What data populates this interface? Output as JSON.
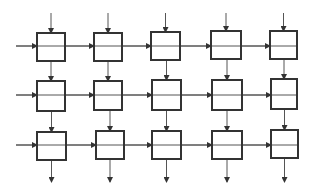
{
  "diagram": {
    "title": "",
    "type": "systolic-array",
    "rows": 3,
    "cols": 5,
    "stroke_color": "#333333",
    "line_color": "#555555",
    "background": "#ffffff",
    "cells": [
      {
        "row": 0,
        "col": 0,
        "x": 37,
        "y": 33,
        "w": 28,
        "h": 28
      },
      {
        "row": 0,
        "col": 1,
        "x": 94,
        "y": 33,
        "w": 28,
        "h": 28
      },
      {
        "row": 0,
        "col": 2,
        "x": 151,
        "y": 32,
        "w": 29,
        "h": 28
      },
      {
        "row": 0,
        "col": 3,
        "x": 211,
        "y": 31,
        "w": 30,
        "h": 28
      },
      {
        "row": 0,
        "col": 4,
        "x": 270,
        "y": 31,
        "w": 27,
        "h": 28
      },
      {
        "row": 1,
        "col": 0,
        "x": 37,
        "y": 81,
        "w": 28,
        "h": 30
      },
      {
        "row": 1,
        "col": 1,
        "x": 94,
        "y": 81,
        "w": 28,
        "h": 29
      },
      {
        "row": 1,
        "col": 2,
        "x": 152,
        "y": 80,
        "w": 29,
        "h": 30
      },
      {
        "row": 1,
        "col": 3,
        "x": 212,
        "y": 80,
        "w": 30,
        "h": 30
      },
      {
        "row": 1,
        "col": 4,
        "x": 271,
        "y": 79,
        "w": 26,
        "h": 30
      },
      {
        "row": 2,
        "col": 0,
        "x": 37,
        "y": 132,
        "w": 29,
        "h": 28
      },
      {
        "row": 2,
        "col": 1,
        "x": 96,
        "y": 131,
        "w": 28,
        "h": 28
      },
      {
        "row": 2,
        "col": 2,
        "x": 152,
        "y": 131,
        "w": 29,
        "h": 28
      },
      {
        "row": 2,
        "col": 3,
        "x": 212,
        "y": 131,
        "w": 30,
        "h": 28
      },
      {
        "row": 2,
        "col": 4,
        "x": 271,
        "y": 130,
        "w": 27,
        "h": 28
      }
    ],
    "row_lines_y": [
      46,
      95,
      145
    ],
    "row_line_x_start": 16,
    "row_line_x_end": 297,
    "top_input_y": 13,
    "bottom_output_y": 182
  }
}
